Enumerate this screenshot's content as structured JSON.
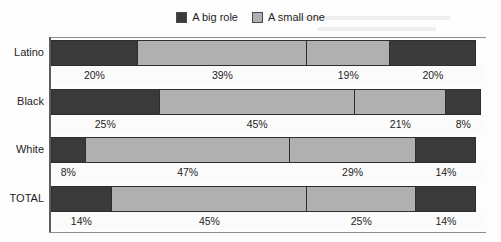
{
  "legend": {
    "items": [
      {
        "label": "A big role",
        "key": "big",
        "color": "#3a3a3a",
        "swatch_icon": "legend-swatch-dark"
      },
      {
        "label": "A small one",
        "key": "small",
        "color": "#b0b0b0",
        "swatch_icon": "legend-swatch-light"
      }
    ]
  },
  "chart_data": {
    "type": "bar",
    "orientation": "horizontal",
    "stacked": true,
    "normalized": true,
    "title": "",
    "subtitle": "",
    "xlabel": "",
    "ylabel": "",
    "xlim": [
      0,
      100
    ],
    "grid": false,
    "legend_position": "top-center",
    "categories": [
      "Latino",
      "Black",
      "White",
      "TOTAL"
    ],
    "legend_entries": [
      "A big role",
      "A small one"
    ],
    "segment_keys": [
      "big",
      "small",
      "small",
      "big"
    ],
    "series": [
      {
        "name": "A big role",
        "key": "big",
        "values": [
          20,
          25,
          8,
          14
        ]
      },
      {
        "name": "A small one",
        "key": "small",
        "values": [
          39,
          45,
          47,
          45
        ]
      },
      {
        "name": "A small one",
        "key": "small",
        "values": [
          19,
          21,
          29,
          25
        ]
      },
      {
        "name": "A big role",
        "key": "big",
        "values": [
          20,
          8,
          14,
          14
        ]
      }
    ],
    "rows": [
      {
        "category": "Latino",
        "segments": [
          {
            "key": "big",
            "value": 20,
            "label": "20%"
          },
          {
            "key": "small",
            "value": 39,
            "label": "39%"
          },
          {
            "key": "small",
            "value": 19,
            "label": "19%"
          },
          {
            "key": "big",
            "value": 20,
            "label": "20%"
          }
        ]
      },
      {
        "category": "Black",
        "segments": [
          {
            "key": "big",
            "value": 25,
            "label": "25%"
          },
          {
            "key": "small",
            "value": 45,
            "label": "45%"
          },
          {
            "key": "small",
            "value": 21,
            "label": "21%"
          },
          {
            "key": "big",
            "value": 8,
            "label": "8%"
          }
        ]
      },
      {
        "category": "White",
        "segments": [
          {
            "key": "big",
            "value": 8,
            "label": "8%"
          },
          {
            "key": "small",
            "value": 47,
            "label": "47%"
          },
          {
            "key": "small",
            "value": 29,
            "label": "29%"
          },
          {
            "key": "big",
            "value": 14,
            "label": "14%"
          }
        ]
      },
      {
        "category": "TOTAL",
        "segments": [
          {
            "key": "big",
            "value": 14,
            "label": "14%"
          },
          {
            "key": "small",
            "value": 45,
            "label": "45%"
          },
          {
            "key": "small",
            "value": 25,
            "label": "25%"
          },
          {
            "key": "big",
            "value": 14,
            "label": "14%"
          }
        ]
      }
    ]
  },
  "colors": {
    "big_role": "#3a3a3a",
    "small_one": "#b0b0b0",
    "background": "#fdfdfd",
    "axis": "#5d5d5d",
    "text": "#1d1d1d"
  }
}
